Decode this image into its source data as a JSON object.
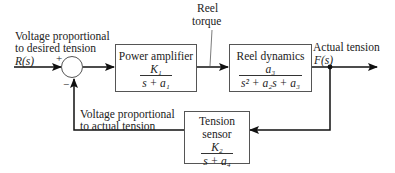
{
  "diagram": {
    "type": "block-diagram",
    "input": {
      "label_line1": "Voltage proportional",
      "label_line2": "to desired tension",
      "signal": "R(s)"
    },
    "summing_junction": {
      "plus_sign": "+",
      "minus_sign": "−"
    },
    "blocks": [
      {
        "id": "power-amplifier",
        "title": "Power amplifier",
        "numerator": "K₁",
        "denominator": "s + a₁"
      },
      {
        "id": "reel-dynamics",
        "title": "Reel dynamics",
        "numerator": "a₃",
        "denominator": "s² + a₂s + a₃"
      },
      {
        "id": "tension-sensor",
        "title_line1": "Tension",
        "title_line2": "sensor",
        "numerator": "K₂",
        "denominator": "s + a₄"
      }
    ],
    "intermediate_signal": {
      "label_line1": "Reel",
      "label_line2": "torque"
    },
    "output": {
      "label": "Actual tension",
      "signal": "F(s)"
    },
    "feedback": {
      "label_line1": "Voltage proportional",
      "label_line2": "to actual tension"
    },
    "colors": {
      "line": "#111111",
      "box_border": "#555555",
      "text": "#222222"
    }
  }
}
